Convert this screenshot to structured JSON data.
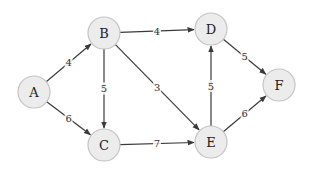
{
  "diagram": {
    "type": "weighted-directed-graph",
    "colors": {
      "background": "#ffffff",
      "node_fill": "#ececec",
      "node_stroke": "#c4c4c4",
      "edge": "#3a3a3a",
      "text": "#222222"
    },
    "nodes": [
      {
        "id": "A",
        "label": "A",
        "x": 34,
        "y": 92
      },
      {
        "id": "B",
        "label": "B",
        "x": 104,
        "y": 33
      },
      {
        "id": "C",
        "label": "C",
        "x": 104,
        "y": 145
      },
      {
        "id": "D",
        "label": "D",
        "x": 211,
        "y": 29
      },
      {
        "id": "E",
        "label": "E",
        "x": 211,
        "y": 142
      },
      {
        "id": "F",
        "label": "F",
        "x": 279,
        "y": 85
      }
    ],
    "edges": [
      {
        "from": "A",
        "to": "B",
        "weight": "4"
      },
      {
        "from": "A",
        "to": "C",
        "weight": "6"
      },
      {
        "from": "B",
        "to": "D",
        "weight": "4"
      },
      {
        "from": "B",
        "to": "C",
        "weight": "5"
      },
      {
        "from": "B",
        "to": "E",
        "weight": "3"
      },
      {
        "from": "C",
        "to": "E",
        "weight": "7"
      },
      {
        "from": "E",
        "to": "D",
        "weight": "5"
      },
      {
        "from": "D",
        "to": "F",
        "weight": "5"
      },
      {
        "from": "E",
        "to": "F",
        "weight": "6"
      }
    ]
  }
}
